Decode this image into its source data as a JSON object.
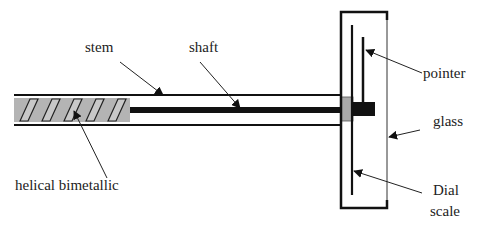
{
  "diagram": {
    "labels": {
      "stem": "stem",
      "shaft": "shaft",
      "helical": "helical bimetallic",
      "pointer": "pointer",
      "glass": "glass",
      "dial_line1": "Dial",
      "dial_line2": "scale"
    },
    "colors": {
      "line": "#111111",
      "element_fill": "#b4b4b4",
      "coupling_fill": "#aaaaaa",
      "text": "#222222",
      "background": "#ffffff"
    }
  }
}
